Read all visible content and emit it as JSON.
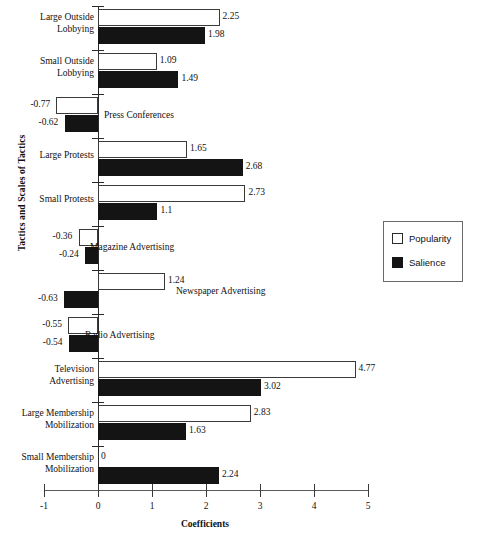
{
  "chart_data": {
    "type": "bar",
    "orientation": "horizontal",
    "title": "",
    "xlabel": "Coefficients",
    "ylabel": "Tactics and Scales of Tactics",
    "xlim": [
      -1,
      5
    ],
    "xticks": [
      "-1",
      "0",
      "1",
      "2",
      "3",
      "4",
      "5"
    ],
    "grid": false,
    "legend_position": "right",
    "categories": [
      "Large Outside\nLobbying",
      "Small Outside\nLobbying",
      "Press Conferences",
      "Large Protests",
      "Small Protests",
      "Magazine Advertising",
      "Newspaper Advertising",
      "Radio Advertising",
      "Television\nAdvertising",
      "Large Membership\nMobilization",
      "Small Membership\nMobilization"
    ],
    "series": [
      {
        "name": "Popularity",
        "color": "#ffffff",
        "values": [
          2.25,
          1.09,
          -0.77,
          1.65,
          2.73,
          -0.36,
          1.24,
          -0.55,
          4.77,
          2.83,
          0
        ]
      },
      {
        "name": "Salience",
        "color": "#141414",
        "values": [
          1.98,
          1.49,
          -0.62,
          2.68,
          1.1,
          -0.24,
          -0.63,
          -0.54,
          3.02,
          1.63,
          2.24
        ]
      }
    ],
    "data_labels": {
      "Popularity": [
        "2.25",
        "1.09",
        "-0.77",
        "1.65",
        "2.73",
        "-0.36",
        "1.24",
        "-0.55",
        "4.77",
        "2.83",
        "0"
      ],
      "Salience": [
        "1.98",
        "1.49",
        "-0.62",
        "2.68",
        "1.1",
        "-0.24",
        "-0.63",
        "-0.54",
        "3.02",
        "1.63",
        "2.24"
      ]
    }
  },
  "legend": {
    "items": [
      {
        "label": "Popularity",
        "swatch": "hollow-square-icon"
      },
      {
        "label": "Salience",
        "swatch": "filled-square-icon"
      }
    ]
  },
  "axes": {
    "x_title": "Coefficients",
    "y_title": "Tactics and Scales of Tactics",
    "x_tick_labels": [
      "-1",
      "0",
      "1",
      "2",
      "3",
      "4",
      "5"
    ]
  }
}
